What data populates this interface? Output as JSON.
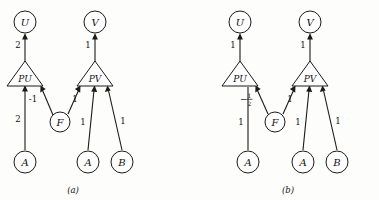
{
  "figure": {
    "background_color": "#fdfdfc",
    "ink_color": "#1a1a1a",
    "panels": [
      {
        "id": "panel-a",
        "caption": "(a)",
        "nodes": [
          {
            "id": "u",
            "label": "U",
            "shape": "circle",
            "role": "output-node"
          },
          {
            "id": "v",
            "label": "V",
            "shape": "circle",
            "role": "output-node"
          },
          {
            "id": "pu",
            "label": "PU",
            "shape": "triangle",
            "role": "process-node"
          },
          {
            "id": "pv",
            "label": "PV",
            "shape": "triangle",
            "role": "process-node"
          },
          {
            "id": "f",
            "label": "F",
            "shape": "circle",
            "role": "factor-node"
          },
          {
            "id": "a1",
            "label": "A",
            "shape": "circle",
            "role": "input-node"
          },
          {
            "id": "a2",
            "label": "A",
            "shape": "circle",
            "role": "input-node"
          },
          {
            "id": "b1",
            "label": "B",
            "shape": "circle",
            "role": "input-node"
          }
        ],
        "edges": [
          {
            "id": "pu-u",
            "from": "pu",
            "to": "u",
            "weight": "2"
          },
          {
            "id": "pv-v",
            "from": "pv",
            "to": "v",
            "weight": "1"
          },
          {
            "id": "a1-pu",
            "from": "a1",
            "to": "pu",
            "weight": "2"
          },
          {
            "id": "f-pu",
            "from": "f",
            "to": "pu",
            "weight": "-1"
          },
          {
            "id": "f-pv",
            "from": "f",
            "to": "pv",
            "weight": "1"
          },
          {
            "id": "a2-pv",
            "from": "a2",
            "to": "pv",
            "weight": "1"
          },
          {
            "id": "b1-pv",
            "from": "b1",
            "to": "pv",
            "weight": "1"
          }
        ]
      },
      {
        "id": "panel-b",
        "caption": "(b)",
        "nodes": [
          {
            "id": "u",
            "label": "U",
            "shape": "circle",
            "role": "output-node"
          },
          {
            "id": "v",
            "label": "V",
            "shape": "circle",
            "role": "output-node"
          },
          {
            "id": "pu",
            "label": "PU",
            "shape": "triangle",
            "role": "process-node"
          },
          {
            "id": "pv",
            "label": "PV",
            "shape": "triangle",
            "role": "process-node"
          },
          {
            "id": "f",
            "label": "F",
            "shape": "circle",
            "role": "factor-node"
          },
          {
            "id": "a1",
            "label": "A",
            "shape": "circle",
            "role": "input-node"
          },
          {
            "id": "a2",
            "label": "A",
            "shape": "circle",
            "role": "input-node"
          },
          {
            "id": "b1",
            "label": "B",
            "shape": "circle",
            "role": "input-node"
          }
        ],
        "edges": [
          {
            "id": "pu-u",
            "from": "pu",
            "to": "u",
            "weight": "1"
          },
          {
            "id": "pv-v",
            "from": "pv",
            "to": "v",
            "weight": "1"
          },
          {
            "id": "a1-pu",
            "from": "a1",
            "to": "pu",
            "weight": "1"
          },
          {
            "id": "f-pu",
            "from": "f",
            "to": "pu",
            "weight": "-1/2",
            "weight_sign": "−",
            "weight_numerator": "1",
            "weight_denominator": "2"
          },
          {
            "id": "f-pv",
            "from": "f",
            "to": "pv",
            "weight": "1"
          },
          {
            "id": "a2-pv",
            "from": "a2",
            "to": "pv",
            "weight": "1"
          },
          {
            "id": "b1-pv",
            "from": "b1",
            "to": "pv",
            "weight": "1"
          }
        ]
      }
    ]
  }
}
